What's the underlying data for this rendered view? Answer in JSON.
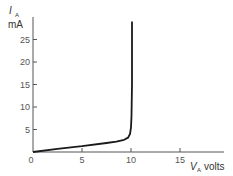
{
  "chart_data": {
    "type": "line",
    "title": "",
    "xlabel": "V_A volts",
    "ylabel": "I_A mA",
    "x_label_parts": {
      "main": "V",
      "sub": "A",
      "unit": "volts"
    },
    "y_label_parts": {
      "main": "I",
      "sub": "A",
      "unit": "mA"
    },
    "xlim": [
      0,
      20
    ],
    "ylim": [
      0,
      28
    ],
    "x_ticks": [
      0,
      5,
      10,
      15
    ],
    "x_tick_labels": [
      "0",
      "5",
      "10",
      "15"
    ],
    "y_ticks": [
      5,
      10,
      15,
      20,
      25
    ],
    "y_tick_labels": [
      "5",
      "10",
      "15",
      "20",
      "25"
    ],
    "grid": false,
    "legend": null,
    "series": [
      {
        "name": "I_A vs V_A",
        "color": "#1a1a1a",
        "x": [
          0,
          2.5,
          5,
          7.5,
          8.5,
          9.3,
          9.7,
          9.9,
          10.0,
          10.05,
          10.1,
          10.1
        ],
        "y": [
          0,
          0.7,
          1.3,
          2.0,
          2.3,
          2.7,
          3.2,
          4.0,
          5.5,
          8.0,
          15.0,
          29.0
        ]
      }
    ]
  }
}
